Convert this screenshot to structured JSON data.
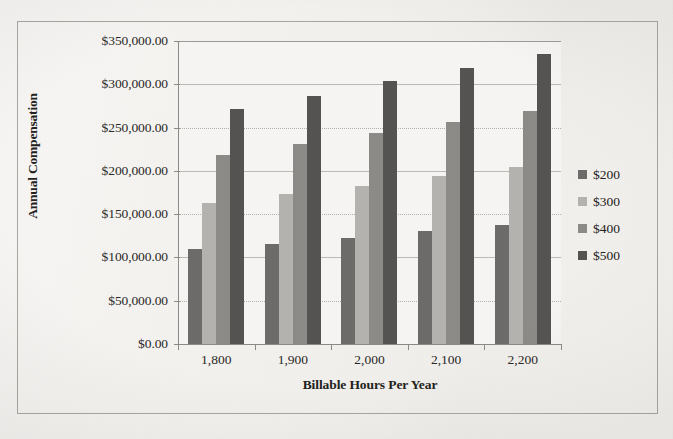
{
  "chart_data": {
    "type": "bar",
    "title": "",
    "subtitle": "",
    "xlabel": "Billable Hours Per Year",
    "ylabel": "Annual Compensation",
    "categories": [
      "1,800",
      "1,900",
      "2,000",
      "2,100",
      "2,200"
    ],
    "series": [
      {
        "name": "$200",
        "color": "#6e6c6a",
        "values": [
          110000,
          116000,
          122000,
          131000,
          138000
        ]
      },
      {
        "name": "$300",
        "color": "#b5b3b0",
        "values": [
          163000,
          173000,
          183000,
          194000,
          204000
        ]
      },
      {
        "name": "$400",
        "color": "#8d8b88",
        "values": [
          218000,
          231000,
          244000,
          257000,
          269000
        ]
      },
      {
        "name": "$500",
        "color": "#565452",
        "values": [
          271000,
          287000,
          304000,
          319000,
          335000
        ]
      }
    ],
    "ylim": [
      0,
      350000
    ],
    "ytick_values": [
      0,
      50000,
      100000,
      150000,
      200000,
      250000,
      300000,
      350000
    ],
    "ytick_labels": [
      "$0.00",
      "$50,000.00",
      "$100,000.00",
      "$150,000.00",
      "$200,000.00",
      "$250,000.00",
      "$300,000.00",
      "$350,000.00"
    ],
    "grid": true,
    "grid_axis": "y",
    "legend_position": "right",
    "legend_entries": [
      "$200",
      "$300",
      "$400",
      "$500"
    ]
  },
  "axes": {
    "y_title": "Annual Compensation",
    "x_title": "Billable Hours Per Year"
  },
  "legend": {
    "items": [
      {
        "label": "$200"
      },
      {
        "label": "$300"
      },
      {
        "label": "$400"
      },
      {
        "label": "$500"
      }
    ]
  }
}
